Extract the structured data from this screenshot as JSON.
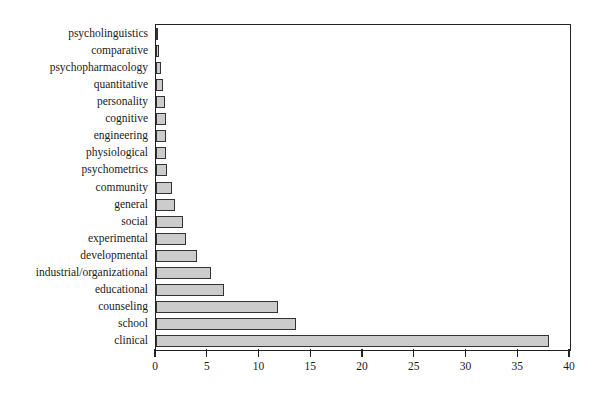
{
  "chart_data": {
    "type": "bar",
    "orientation": "horizontal",
    "title": "",
    "subtitle": "",
    "xlabel": "",
    "ylabel": "",
    "xlim": [
      0,
      40
    ],
    "ylim": null,
    "grid": false,
    "legend": null,
    "xticks": [
      0,
      5,
      10,
      15,
      20,
      25,
      30,
      35,
      40
    ],
    "xtick_labels": [
      "0",
      "5",
      "10",
      "15",
      "20",
      "25",
      "30",
      "35",
      "40"
    ],
    "categories": [
      "psycholinguistics",
      "comparative",
      "psychopharmacology",
      "quantitative",
      "personality",
      "cognitive",
      "engineering",
      "physiological",
      "psychometrics",
      "community",
      "general",
      "social",
      "experimental",
      "developmental",
      "industrial/organizational",
      "educational",
      "counseling",
      "school",
      "clinical"
    ],
    "values": [
      0.2,
      0.3,
      0.5,
      0.7,
      0.9,
      1.0,
      1.0,
      1.0,
      1.1,
      1.5,
      1.8,
      2.6,
      2.9,
      4.0,
      5.3,
      6.6,
      11.8,
      13.5,
      38.0
    ],
    "bar_color": "#cccccc",
    "bar_edge_color": "#333333",
    "axis_color": "#222222"
  }
}
